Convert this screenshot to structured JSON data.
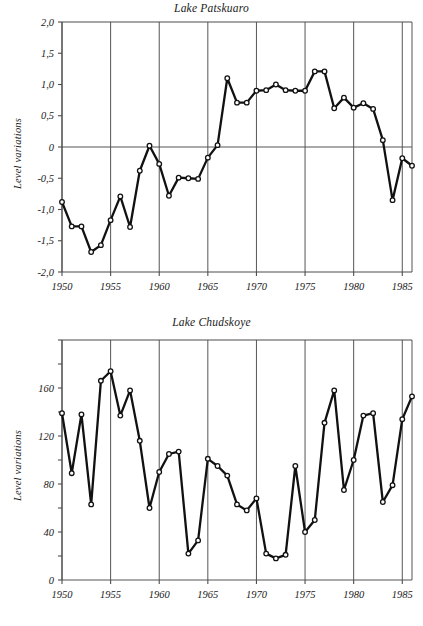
{
  "figure": {
    "ylabel": "Level variations",
    "xlabel": ""
  },
  "chart_data": [
    {
      "type": "line",
      "title": "Lake Patskuaro",
      "xlabel": "",
      "ylabel": "Level variations",
      "xlim": [
        1950,
        1986
      ],
      "ylim": [
        -2.0,
        2.0
      ],
      "grid": true,
      "legend": "none",
      "xticks": [
        1950,
        1955,
        1960,
        1965,
        1970,
        1975,
        1980,
        1985
      ],
      "xticklabels": [
        "1950",
        "1955",
        "1960",
        "1965",
        "1970",
        "1975",
        "1980",
        "1985"
      ],
      "yticks": [
        -2.0,
        -1.5,
        -1.0,
        -0.5,
        0,
        0.5,
        1.0,
        1.5,
        2.0
      ],
      "yticklabels": [
        "-2,0",
        "-1,5",
        "-1,0",
        "-0,5",
        "0",
        "0,5",
        "1,0",
        "1,5",
        "2,0"
      ],
      "x": [
        1950,
        1951,
        1952,
        1953,
        1954,
        1955,
        1956,
        1957,
        1958,
        1959,
        1960,
        1961,
        1962,
        1963,
        1964,
        1965,
        1966,
        1967,
        1968,
        1969,
        1970,
        1971,
        1972,
        1973,
        1974,
        1975,
        1976,
        1977,
        1978,
        1979,
        1980,
        1981,
        1982,
        1983,
        1984,
        1985,
        1986
      ],
      "values": [
        -0.88,
        -1.27,
        -1.27,
        -1.68,
        -1.57,
        -1.17,
        -0.79,
        -1.28,
        -0.38,
        0.02,
        -0.27,
        -0.78,
        -0.49,
        -0.5,
        -0.51,
        -0.17,
        0.03,
        1.1,
        0.71,
        0.71,
        0.9,
        0.91,
        1.0,
        0.91,
        0.9,
        0.9,
        1.21,
        1.21,
        0.62,
        0.79,
        0.63,
        0.7,
        0.61,
        0.11,
        -0.85,
        -0.18,
        -0.3
      ]
    },
    {
      "type": "line",
      "title": "Lake Chudskoye",
      "xlabel": "",
      "ylabel": "Level variations",
      "xlim": [
        1950,
        1986
      ],
      "ylim": [
        0,
        200
      ],
      "grid": true,
      "legend": "none",
      "xticks": [
        1950,
        1955,
        1960,
        1965,
        1970,
        1975,
        1980,
        1985
      ],
      "xticklabels": [
        "1950",
        "1955",
        "1960",
        "1965",
        "1970",
        "1975",
        "1980",
        "1985"
      ],
      "yticks": [
        0,
        20,
        40,
        60,
        80,
        100,
        120,
        140,
        160,
        180,
        200
      ],
      "yticklabels": [
        "0",
        "",
        "40",
        "",
        "80",
        "",
        "120",
        "",
        "160",
        "",
        ""
      ],
      "x": [
        1950,
        1951,
        1952,
        1953,
        1954,
        1955,
        1956,
        1957,
        1958,
        1959,
        1960,
        1961,
        1962,
        1963,
        1964,
        1965,
        1966,
        1967,
        1968,
        1969,
        1970,
        1971,
        1972,
        1973,
        1974,
        1975,
        1976,
        1977,
        1978,
        1979,
        1980,
        1981,
        1982,
        1983,
        1984,
        1985,
        1986
      ],
      "values": [
        139,
        89,
        138,
        63,
        166,
        174,
        137,
        158,
        116,
        60,
        90,
        105,
        107,
        22,
        33,
        101,
        95,
        87,
        63,
        58,
        68,
        22,
        18,
        21,
        95,
        40,
        50,
        131,
        158,
        75,
        100,
        137,
        139,
        65,
        79,
        134,
        153
      ]
    }
  ]
}
